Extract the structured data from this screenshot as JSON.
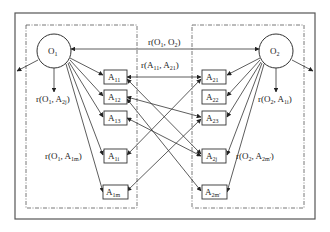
{
  "diagram": {
    "type": "ontology-matching",
    "colors": {
      "line": "#333333",
      "frame": "#555555",
      "background": "#ffffff"
    },
    "ontologies": [
      {
        "id": "O1",
        "label": "O",
        "sub": "1"
      },
      {
        "id": "O2",
        "label": "O",
        "sub": "2"
      }
    ],
    "left_attributes": [
      {
        "id": "A11",
        "label": "A",
        "sub": "11"
      },
      {
        "id": "A12",
        "label": "A",
        "sub": "12"
      },
      {
        "id": "A13",
        "label": "A",
        "sub": "13"
      },
      {
        "id": "A1i",
        "label": "A",
        "sub": "1i"
      },
      {
        "id": "A1m",
        "label": "A",
        "sub": "1m"
      }
    ],
    "right_attributes": [
      {
        "id": "A21",
        "label": "A",
        "sub": "21"
      },
      {
        "id": "A22",
        "label": "A",
        "sub": "22"
      },
      {
        "id": "A23",
        "label": "A",
        "sub": "23"
      },
      {
        "id": "A2j",
        "label": "A",
        "sub": "2j"
      },
      {
        "id": "A2m'",
        "label": "A",
        "sub": "2m'"
      }
    ],
    "relations": {
      "o1_o2": {
        "pre": "r(O",
        "s1": "1",
        "mid": ", O",
        "s2": "2",
        "post": ")"
      },
      "a11_a21": {
        "pre": "r(A",
        "s1": "11",
        "mid": ", A",
        "s2": "21",
        "post": ")"
      },
      "o1_a2j": {
        "pre": "r(O",
        "s1": "1",
        "mid": ", A",
        "s2": "2j",
        "post": ")"
      },
      "o2_a1i": {
        "pre": "r(O",
        "s1": "2",
        "mid": ", A",
        "s2": "1i",
        "post": ")"
      },
      "o1_a1m": {
        "pre": "r(O",
        "s1": "1",
        "mid": ", A",
        "s2": "1m",
        "post": ")"
      },
      "o2_a2m": {
        "pre": "r(O",
        "s1": "2",
        "mid": ", A",
        "s2": "2m'",
        "post": ")"
      }
    }
  }
}
